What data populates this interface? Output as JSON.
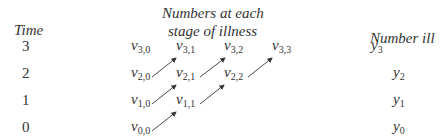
{
  "headers": {
    "time": "Time",
    "stages_line1": "Numbers at each",
    "stages_line2": "stage of illness",
    "number_ill": "Number ill"
  },
  "rows": [
    {
      "time": "3",
      "y_sub": "3",
      "cells": [
        {
          "sub": "3,0"
        },
        {
          "sub": "3,1"
        },
        {
          "sub": "3,2"
        },
        {
          "sub": "3,3"
        }
      ]
    },
    {
      "time": "2",
      "y_sub": "2",
      "cells": [
        {
          "sub": "2,0"
        },
        {
          "sub": "2,1"
        },
        {
          "sub": "2,2"
        }
      ]
    },
    {
      "time": "1",
      "y_sub": "1",
      "cells": [
        {
          "sub": "1,0"
        },
        {
          "sub": "1,1"
        }
      ]
    },
    {
      "time": "0",
      "y_sub": "0",
      "cells": [
        {
          "sub": "0,0"
        }
      ]
    }
  ],
  "symbols": {
    "v": "v",
    "y": "y"
  },
  "arrows": [
    {
      "from": "v_0,0",
      "to": "v_1,1"
    },
    {
      "from": "v_1,0",
      "to": "v_2,1"
    },
    {
      "from": "v_1,1",
      "to": "v_2,2"
    },
    {
      "from": "v_2,0",
      "to": "v_3,1"
    },
    {
      "from": "v_2,1",
      "to": "v_3,2"
    },
    {
      "from": "v_2,2",
      "to": "v_3,3"
    }
  ]
}
